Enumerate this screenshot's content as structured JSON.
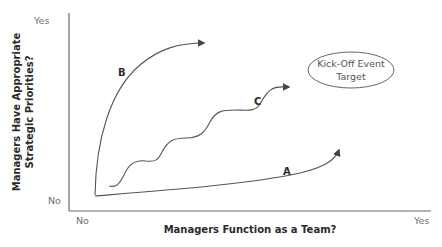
{
  "diagram": {
    "y_axis": {
      "title_line1": "Managers Have Appropriate",
      "title_line2": "Strategic Priorities?",
      "top_label": "Yes",
      "bottom_label": "No"
    },
    "x_axis": {
      "title": "Managers Function as a Team?",
      "left_label": "No",
      "right_label": "Yes"
    },
    "curves": [
      {
        "id": "A",
        "label": "A",
        "description": "slow gradual rise along team axis"
      },
      {
        "id": "B",
        "label": "B",
        "description": "steep rise in strategic priorities"
      },
      {
        "id": "C",
        "label": "C",
        "description": "wavy stepwise rise toward target"
      }
    ],
    "target": {
      "line1": "Kick-Off Event",
      "line2": "Target"
    },
    "colors": {
      "line": "#555555",
      "axis": "#666666",
      "text": "#2b2b2b",
      "tick_text": "#6f6f6f"
    }
  }
}
